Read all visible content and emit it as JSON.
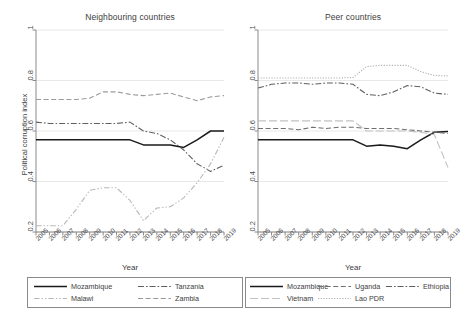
{
  "figure": {
    "ylabel": "Political corruption index",
    "xlabel_left": "Year",
    "xlabel_right": "Year"
  },
  "panels": [
    {
      "key": "left",
      "title": "Neighbouring countries"
    },
    {
      "key": "right",
      "title": "Peer countries"
    }
  ],
  "axis": {
    "yticks": [
      "0.2",
      "0.4",
      "0.6",
      "0.8",
      "1"
    ],
    "ytick_values": [
      0.2,
      0.4,
      0.6,
      0.8,
      1
    ],
    "xticks": [
      "2005",
      "2006",
      "2007",
      "2008",
      "2009",
      "2010",
      "2011",
      "2012",
      "2013",
      "2014",
      "2015",
      "2016",
      "2017",
      "2018",
      "2019"
    ]
  },
  "legend_left": {
    "entries": [
      {
        "label": "Mozambique",
        "style": "solid",
        "color": "#1a1a1a"
      },
      {
        "label": "Tanzania",
        "style": "dashdot",
        "color": "#5f5f5f"
      },
      {
        "label": "Malawi",
        "style": "dashdotdot",
        "color": "#b8b8b8"
      },
      {
        "label": "Zambia",
        "style": "dashed",
        "color": "#9a9a9a"
      }
    ]
  },
  "legend_right": {
    "entries": [
      {
        "label": "Mozambique",
        "style": "solid",
        "color": "#1a1a1a"
      },
      {
        "label": "Uganda",
        "style": "dashed",
        "color": "#6e6e6e"
      },
      {
        "label": "Ethiopia",
        "style": "dashdot",
        "color": "#5f5f5f"
      },
      {
        "label": "Vietnam",
        "style": "longdash",
        "color": "#c2c2c2"
      },
      {
        "label": "Lao PDR",
        "style": "dotted",
        "color": "#b0b0b0"
      }
    ]
  },
  "chart_data": [
    {
      "type": "line",
      "title": "Neighbouring countries",
      "xlabel": "Year",
      "ylabel": "Political corruption index",
      "x": [
        2005,
        2006,
        2007,
        2008,
        2009,
        2010,
        2011,
        2012,
        2013,
        2014,
        2015,
        2016,
        2017,
        2018,
        2019
      ],
      "xlim": [
        2005,
        2019
      ],
      "ylim": [
        0.2,
        1.0
      ],
      "grid": "horizontal",
      "legend": "below",
      "series": [
        {
          "name": "Mozambique",
          "style": "solid",
          "color": "#1a1a1a",
          "values": [
            0.565,
            0.565,
            0.565,
            0.565,
            0.565,
            0.565,
            0.565,
            0.565,
            0.545,
            0.545,
            0.545,
            0.535,
            0.565,
            0.6,
            0.6
          ]
        },
        {
          "name": "Tanzania",
          "style": "dashdot",
          "color": "#5f5f5f",
          "values": [
            0.635,
            0.63,
            0.63,
            0.63,
            0.63,
            0.63,
            0.63,
            0.635,
            0.6,
            0.59,
            0.565,
            0.525,
            0.47,
            0.44,
            0.465
          ]
        },
        {
          "name": "Malawi",
          "style": "dashdotdot",
          "color": "#b8b8b8",
          "values": [
            0.225,
            0.225,
            0.225,
            0.29,
            0.365,
            0.375,
            0.375,
            0.325,
            0.245,
            0.295,
            0.3,
            0.335,
            0.395,
            0.47,
            0.575
          ]
        },
        {
          "name": "Zambia",
          "style": "dashed",
          "color": "#9a9a9a",
          "values": [
            0.725,
            0.725,
            0.725,
            0.725,
            0.73,
            0.755,
            0.755,
            0.745,
            0.74,
            0.745,
            0.75,
            0.735,
            0.72,
            0.735,
            0.74
          ]
        }
      ]
    },
    {
      "type": "line",
      "title": "Peer countries",
      "xlabel": "Year",
      "ylabel": "Political corruption index",
      "x": [
        2005,
        2006,
        2007,
        2008,
        2009,
        2010,
        2011,
        2012,
        2013,
        2014,
        2015,
        2016,
        2017,
        2018,
        2019
      ],
      "xlim": [
        2005,
        2019
      ],
      "ylim": [
        0.2,
        1.0
      ],
      "grid": "horizontal",
      "legend": "below",
      "series": [
        {
          "name": "Mozambique",
          "style": "solid",
          "color": "#1a1a1a",
          "values": [
            0.565,
            0.565,
            0.565,
            0.565,
            0.565,
            0.565,
            0.565,
            0.565,
            0.54,
            0.545,
            0.54,
            0.53,
            0.565,
            0.595,
            0.598
          ]
        },
        {
          "name": "Uganda",
          "style": "dashed",
          "color": "#6e6e6e",
          "values": [
            0.61,
            0.61,
            0.61,
            0.605,
            0.615,
            0.61,
            0.615,
            0.615,
            0.61,
            0.61,
            0.61,
            0.605,
            0.6,
            0.595,
            0.59
          ]
        },
        {
          "name": "Ethiopia",
          "style": "dashdot",
          "color": "#5f5f5f",
          "values": [
            0.77,
            0.785,
            0.79,
            0.79,
            0.785,
            0.79,
            0.79,
            0.785,
            0.745,
            0.74,
            0.755,
            0.78,
            0.775,
            0.75,
            0.745
          ]
        },
        {
          "name": "Vietnam",
          "style": "longdash",
          "color": "#c2c2c2",
          "values": [
            0.64,
            0.64,
            0.64,
            0.64,
            0.64,
            0.64,
            0.64,
            0.64,
            0.6,
            0.6,
            0.6,
            0.6,
            0.595,
            0.585,
            0.455
          ]
        },
        {
          "name": "Lao PDR",
          "style": "dotted",
          "color": "#b0b0b0",
          "values": [
            0.81,
            0.81,
            0.81,
            0.81,
            0.81,
            0.81,
            0.81,
            0.812,
            0.855,
            0.86,
            0.86,
            0.86,
            0.835,
            0.82,
            0.818
          ]
        }
      ]
    }
  ]
}
